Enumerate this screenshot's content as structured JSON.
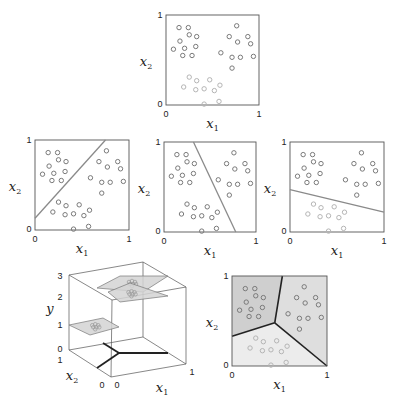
{
  "figure": {
    "axis_labels": {
      "x": "x",
      "x_sub": "1",
      "y": "x",
      "y_sub": "2",
      "z": "y"
    },
    "ticks": {
      "zero": "0",
      "one": "1",
      "two": "2",
      "three": "3"
    },
    "colors": {
      "frame": "#555555",
      "line": "#8a8a8a",
      "thick_line": "#222222",
      "point_dark": "#7a7a7a",
      "point_light": "#b5b5b5",
      "region_a": "#cfcfcf",
      "region_b": "#dedede",
      "region_c": "#ececec",
      "plane": "#d4d4d4"
    },
    "clusters": {
      "A": [
        [
          0.14,
          0.86
        ],
        [
          0.24,
          0.86
        ],
        [
          0.25,
          0.78
        ],
        [
          0.33,
          0.76
        ],
        [
          0.15,
          0.71
        ],
        [
          0.08,
          0.62
        ],
        [
          0.2,
          0.63
        ],
        [
          0.32,
          0.65
        ],
        [
          0.18,
          0.55
        ],
        [
          0.28,
          0.55
        ]
      ],
      "B": [
        [
          0.76,
          0.88
        ],
        [
          0.68,
          0.76
        ],
        [
          0.88,
          0.76
        ],
        [
          0.77,
          0.7
        ],
        [
          0.91,
          0.68
        ],
        [
          0.59,
          0.58
        ],
        [
          0.71,
          0.53
        ],
        [
          0.8,
          0.53
        ],
        [
          0.94,
          0.54
        ],
        [
          0.71,
          0.41
        ]
      ],
      "C": [
        [
          0.25,
          0.31
        ],
        [
          0.33,
          0.27
        ],
        [
          0.47,
          0.28
        ],
        [
          0.19,
          0.2
        ],
        [
          0.58,
          0.22
        ],
        [
          0.32,
          0.17
        ],
        [
          0.41,
          0.18
        ],
        [
          0.52,
          0.16
        ],
        [
          0.41,
          0.01
        ],
        [
          0.57,
          0.04
        ]
      ]
    },
    "panels": [
      {
        "id": "top-scatter",
        "x": 166,
        "y": 15,
        "w": 93,
        "h": 90,
        "separator": null
      },
      {
        "id": "separator-a-vs-rest",
        "x": 35,
        "y": 140,
        "w": 94,
        "h": 90,
        "separator": [
          [
            0.0,
            0.13
          ],
          [
            0.75,
            1.0
          ]
        ]
      },
      {
        "id": "separator-b-vs-rest",
        "x": 164,
        "y": 142,
        "w": 92,
        "h": 90,
        "separator": [
          [
            0.32,
            1.0
          ],
          [
            0.78,
            0.0
          ]
        ]
      },
      {
        "id": "separator-c-vs-rest",
        "x": 290,
        "y": 142,
        "w": 94,
        "h": 90,
        "separator": [
          [
            0.0,
            0.47
          ],
          [
            1.0,
            0.22
          ]
        ]
      },
      {
        "id": "partition",
        "x": 232,
        "y": 276,
        "w": 95,
        "h": 90,
        "junction": [
          0.45,
          0.48
        ],
        "boundary_ends": [
          [
            0.0,
            0.33
          ],
          [
            0.53,
            1.0
          ],
          [
            1.0,
            0.0
          ]
        ]
      }
    ],
    "cube": {
      "back_left_top": [
        69,
        275
      ],
      "back_right_top": [
        143,
        262
      ],
      "front_right_top": [
        186,
        287
      ],
      "front_left_top": [
        112,
        300
      ],
      "back_left_bottom": [
        69,
        350
      ],
      "back_right_bottom": [
        143,
        337
      ],
      "front_right_bottom": [
        186,
        364
      ],
      "front_left_bottom": [
        111,
        377
      ],
      "y_junction": [
        119,
        353
      ],
      "y_branches": [
        [
          103,
          343
        ],
        [
          168,
          353
        ],
        [
          97,
          368
        ]
      ],
      "planes": [
        {
          "level": "1",
          "points": [
            [
              69,
              325
            ],
            [
              103,
              318
            ],
            [
              119,
              327
            ],
            [
              90,
              335
            ]
          ]
        },
        {
          "level": "3-upper",
          "points": [
            [
              97,
              288
            ],
            [
              120,
              276
            ],
            [
              168,
              276
            ],
            [
              143,
              292
            ]
          ]
        },
        {
          "level": "2",
          "points": [
            [
              108,
              292
            ],
            [
              130,
              283
            ],
            [
              168,
              296
            ],
            [
              120,
              302
            ]
          ]
        }
      ]
    }
  }
}
